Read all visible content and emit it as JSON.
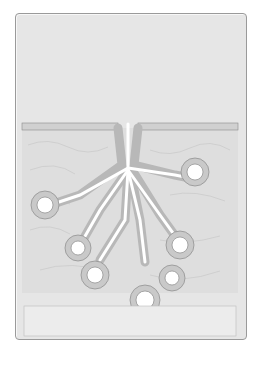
{
  "callout": {
    "text": "Glandular epithelia synthesize and secrete a precursor fluid into a duct. Ductal cells then modify the ion or water content of this fluid."
  },
  "labels": {
    "apical_surface": "Apical surface",
    "exocrine_gland_duct_line1": "Exocrine gland",
    "exocrine_gland_duct_line2": "duct",
    "secretory_cells_line1": "Secretory",
    "secretory_cells_line2": "cells"
  },
  "colors": {
    "panel_bg": "#e6e6e6",
    "tissue": "#dcdcdc",
    "cell_outline": "#8a8a8a",
    "lumen": "#ffffff",
    "blood_vessel": "#ececec",
    "rbc": "#8a6a6a"
  }
}
